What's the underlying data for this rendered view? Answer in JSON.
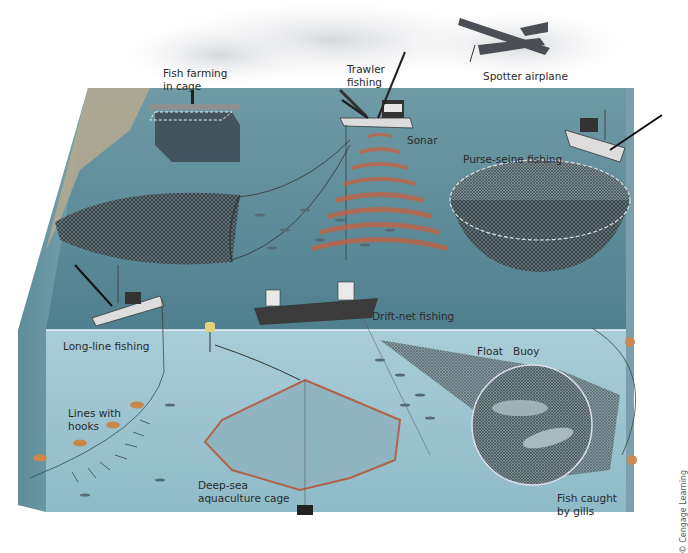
{
  "diagram": {
    "colors": {
      "sky": "#f2f3f5",
      "sea_surface": "#5f8f9b",
      "sea_surface_far": "#7aa3ad",
      "cross_section_front": "#9cc3cf",
      "cross_section_side": "#6e9aa8",
      "seafloor_shore": "#b9a98c",
      "net": "#3e4a50",
      "sonar": "#c65a3c",
      "label_text": "#2a2a2a"
    },
    "labels": {
      "fish_farming": "Fish farming\nin cage",
      "trawler": "Trawler\nfishing",
      "spotter": "Spotter airplane",
      "sonar": "Sonar",
      "purse_seine": "Purse-seine fishing",
      "drift_net": "Drift-net fishing",
      "long_line": "Long-line fishing",
      "lines_with_hooks": "Lines with\nhooks",
      "deep_sea_cage": "Deep-sea\naquaculture cage",
      "float": "Float",
      "buoy": "Buoy",
      "fish_caught": "Fish caught\nby gills"
    },
    "credit": "© Cengage Learning"
  }
}
